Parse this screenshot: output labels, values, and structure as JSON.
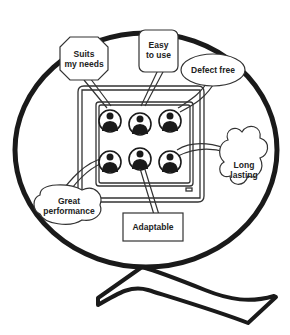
{
  "diagram": {
    "colors": {
      "stroke": "#1a1a1a",
      "fill": "#ffffff",
      "avatar": "#1a1a1a"
    },
    "callouts": [
      {
        "id": "suits",
        "line1": "Suits",
        "line2": "my needs",
        "shape": "octagon"
      },
      {
        "id": "easy",
        "line1": "Easy",
        "line2": "to use",
        "shape": "rounded-rect"
      },
      {
        "id": "defect",
        "line1": "Defect free",
        "line2": "",
        "shape": "oval"
      },
      {
        "id": "long",
        "line1": "Long",
        "line2": "lasting",
        "shape": "cloud"
      },
      {
        "id": "great",
        "line1": "Great",
        "line2": "performance",
        "shape": "cloud"
      },
      {
        "id": "adapt",
        "line1": "Adaptable",
        "line2": "",
        "shape": "rectangle"
      }
    ],
    "avatars": 6
  }
}
